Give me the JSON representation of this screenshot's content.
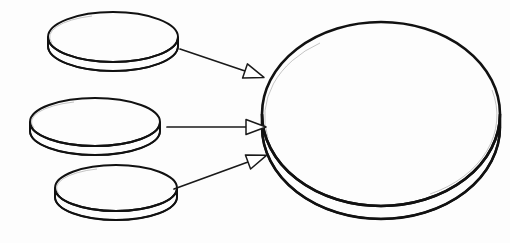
{
  "figure": {
    "title": "",
    "caption": "",
    "background_color": "#fdfdfd",
    "line_color": "#111111",
    "fill_color": "#ffffff",
    "shading_color": "#8f8f8f"
  },
  "shapes": {
    "small_discs": [
      {
        "id": "small-disc-top",
        "label": "",
        "cx": 113,
        "cy": 37,
        "rx": 65,
        "ry": 25,
        "thickness": 9,
        "stroke_width": 2.0
      },
      {
        "id": "small-disc-middle",
        "label": "",
        "cx": 95,
        "cy": 122,
        "rx": 65,
        "ry": 24,
        "thickness": 9,
        "stroke_width": 2.0
      },
      {
        "id": "small-disc-bottom",
        "label": "",
        "cx": 116,
        "cy": 188,
        "rx": 61,
        "ry": 23,
        "thickness": 9,
        "stroke_width": 2.0
      }
    ],
    "large_disc": {
      "id": "large-disc",
      "label": "",
      "cx": 381,
      "cy": 114,
      "rx": 119,
      "ry": 92,
      "thickness": 13,
      "stroke_width": 2.6
    }
  },
  "arrows": [
    {
      "id": "arrow-top",
      "label": "",
      "from_shape": "small-disc-top",
      "to_shape": "large-disc",
      "x1": 180,
      "y1": 49,
      "x2": 245,
      "y2": 71,
      "head_length": 20,
      "head_width": 15
    },
    {
      "id": "arrow-middle",
      "label": "",
      "from_shape": "small-disc-middle",
      "to_shape": "large-disc",
      "x1": 167,
      "y1": 127,
      "x2": 246,
      "y2": 127,
      "head_length": 20,
      "head_width": 15
    },
    {
      "id": "arrow-bottom",
      "label": "",
      "from_shape": "small-disc-bottom",
      "to_shape": "large-disc",
      "x1": 174,
      "y1": 189,
      "x2": 248,
      "y2": 162,
      "head_length": 20,
      "head_width": 15
    }
  ]
}
